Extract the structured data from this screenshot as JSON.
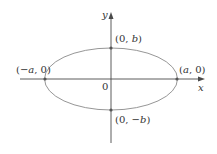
{
  "diagram": {
    "type": "ellipse-on-axes",
    "colors": {
      "axis": "#4a4a4a",
      "ellipse": "#8a8a8a",
      "point": "#555555",
      "text": "#333333"
    },
    "axes": {
      "x_label": "x",
      "y_label": "y",
      "origin_label": "0"
    },
    "points": [
      {
        "id": "top",
        "label": "(0, b)",
        "parts": [
          "(0, ",
          "b",
          ")"
        ]
      },
      {
        "id": "bottom",
        "label": "(0, −b)",
        "parts": [
          "(0, −",
          "b",
          ")"
        ]
      },
      {
        "id": "left",
        "label": "(−a, 0)",
        "parts": [
          "(−",
          "a",
          ", 0)"
        ]
      },
      {
        "id": "right",
        "label": "(a, 0)",
        "parts": [
          "(",
          "a",
          ", 0)"
        ]
      }
    ]
  }
}
